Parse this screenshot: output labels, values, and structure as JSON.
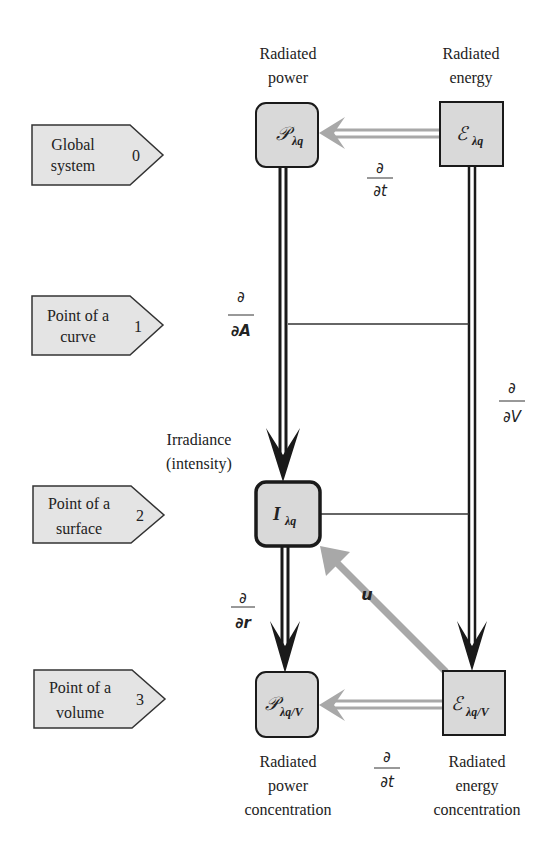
{
  "levels": [
    {
      "line1": "Global",
      "line2": "system",
      "index": "0"
    },
    {
      "line1": "Point of a",
      "line2": "curve",
      "index": "1"
    },
    {
      "line1": "Point of a",
      "line2": "surface",
      "index": "2"
    },
    {
      "line1": "Point of a",
      "line2": "volume",
      "index": "3"
    }
  ],
  "headers": {
    "power": {
      "line1": "Radiated",
      "line2": "power"
    },
    "energy": {
      "line1": "Radiated",
      "line2": "energy"
    },
    "irradiance": {
      "line1": "Irradiance",
      "line2": "(intensity)"
    },
    "power_conc": {
      "line1": "Radiated",
      "line2": "power",
      "line3": "concentration"
    },
    "energy_conc": {
      "line1": "Radiated",
      "line2": "energy",
      "line3": "concentration"
    }
  },
  "nodes": {
    "P": {
      "symbol": "𝒫",
      "sub": "λq"
    },
    "E": {
      "symbol": "ℰ",
      "sub": "λq"
    },
    "I": {
      "symbol": "I",
      "sub": "λq"
    },
    "PV": {
      "symbol": "𝒫",
      "sub": "λq/V"
    },
    "EV": {
      "symbol": "ℰ",
      "sub": "λq/V"
    }
  },
  "operators": {
    "dt_top": {
      "num": "∂",
      "den": "∂t"
    },
    "dA": {
      "num": "∂",
      "den": "∂A"
    },
    "dV": {
      "num": "∂",
      "den": "∂V"
    },
    "dr": {
      "num": "∂",
      "den": "∂r"
    },
    "dt_bottom": {
      "num": "∂",
      "den": "∂t"
    },
    "u": "u"
  },
  "colors": {
    "box_fill": "#d9d9d9",
    "label_fill": "#e4e4e4",
    "stroke": "#1a1a1a",
    "gray_arrow": "#a8a8a8"
  }
}
